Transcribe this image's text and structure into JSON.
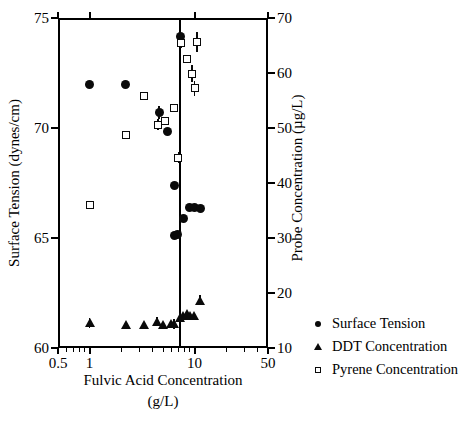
{
  "chart_data": {
    "type": "scatter",
    "title": "",
    "xlabel": "Fulvic Acid Concentration",
    "xlabel_line2": "(g/L)",
    "ylabel": "Surface Tension (dynes/cm)",
    "ylabel_right": "Probe Concentration (µg/L)",
    "xscale": "log",
    "xlim": [
      0.5,
      50
    ],
    "ylim": [
      60,
      75
    ],
    "ylim_right": [
      10,
      70
    ],
    "grid": false,
    "legend_position": "right-bottom",
    "xticks": [
      {
        "value": 0.5,
        "label": "0.5"
      },
      {
        "value": 1,
        "label": "1"
      },
      {
        "value": 10,
        "label": "10"
      },
      {
        "value": 50,
        "label": "50"
      }
    ],
    "xticks_minor": [
      0.6,
      0.7,
      0.8,
      0.9,
      2,
      3,
      4,
      5,
      6,
      7,
      8,
      9,
      20,
      30,
      40
    ],
    "yticks_left": [
      {
        "value": 60,
        "label": "60"
      },
      {
        "value": 65,
        "label": "65"
      },
      {
        "value": 70,
        "label": "70"
      },
      {
        "value": 75,
        "label": "75"
      }
    ],
    "yticks_right": [
      {
        "value": 10,
        "label": "10"
      },
      {
        "value": 20,
        "label": "20"
      },
      {
        "value": 30,
        "label": "30"
      },
      {
        "value": 40,
        "label": "40"
      },
      {
        "value": 50,
        "label": "50"
      },
      {
        "value": 60,
        "label": "60"
      },
      {
        "value": 70,
        "label": "70"
      }
    ],
    "reference_line": {
      "x": 7.3,
      "orientation": "vertical"
    },
    "series": [
      {
        "name": "Surface Tension",
        "marker": "filled-circle",
        "axis": "left",
        "points": [
          {
            "x": 1.0,
            "y": 72.0
          },
          {
            "x": 2.2,
            "y": 72.0
          },
          {
            "x": 4.6,
            "y": 70.7,
            "yerr": 0.3
          },
          {
            "x": 5.5,
            "y": 69.85
          },
          {
            "x": 6.4,
            "y": 67.4
          },
          {
            "x": 6.5,
            "y": 65.1
          },
          {
            "x": 6.9,
            "y": 65.15
          },
          {
            "x": 7.9,
            "y": 65.9
          },
          {
            "x": 9.0,
            "y": 66.4
          },
          {
            "x": 10.0,
            "y": 66.4
          },
          {
            "x": 11.5,
            "y": 66.35
          },
          {
            "x": 7.4,
            "y": 74.15
          }
        ]
      },
      {
        "name": "DDT Concentration",
        "marker": "filled-triangle",
        "axis": "right",
        "points": [
          {
            "x": 1.0,
            "y": 14.6,
            "yerr": 0.9
          },
          {
            "x": 2.2,
            "y": 14.2
          },
          {
            "x": 3.3,
            "y": 14.3
          },
          {
            "x": 4.4,
            "y": 14.8,
            "yerr": 0.8
          },
          {
            "x": 5.0,
            "y": 14.2
          },
          {
            "x": 5.9,
            "y": 14.4
          },
          {
            "x": 6.4,
            "y": 14.4,
            "yerr": 0.9
          },
          {
            "x": 7.2,
            "y": 15.5,
            "yerr": 0.8
          },
          {
            "x": 7.8,
            "y": 15.9
          },
          {
            "x": 8.4,
            "y": 16.2
          },
          {
            "x": 9.0,
            "y": 16.0
          },
          {
            "x": 9.8,
            "y": 16.0
          },
          {
            "x": 11.3,
            "y": 18.7,
            "yerr": 0.9
          }
        ]
      },
      {
        "name": "Pyrene Concentration",
        "marker": "open-square",
        "axis": "right",
        "points": [
          {
            "x": 1.0,
            "y": 36.0
          },
          {
            "x": 2.2,
            "y": 48.8
          },
          {
            "x": 3.3,
            "y": 55.9
          },
          {
            "x": 4.5,
            "y": 50.6,
            "yerr": 1.0
          },
          {
            "x": 5.2,
            "y": 51.2
          },
          {
            "x": 6.4,
            "y": 53.7
          },
          {
            "x": 7.0,
            "y": 44.6,
            "yerr": 1.0
          },
          {
            "x": 7.4,
            "y": 65.5,
            "yerr": 1.0
          },
          {
            "x": 8.4,
            "y": 62.5
          },
          {
            "x": 9.5,
            "y": 59.9,
            "yerr": 1.6
          },
          {
            "x": 10.6,
            "y": 65.6,
            "yerr": 1.8
          },
          {
            "x": 10.0,
            "y": 57.2,
            "yerr": 1.3
          }
        ]
      }
    ],
    "legend": [
      {
        "label": "Surface Tension",
        "marker": "filled-circle"
      },
      {
        "label": "DDT Concentration",
        "marker": "filled-triangle"
      },
      {
        "label": "Pyrene Concentration",
        "marker": "open-square"
      }
    ]
  }
}
